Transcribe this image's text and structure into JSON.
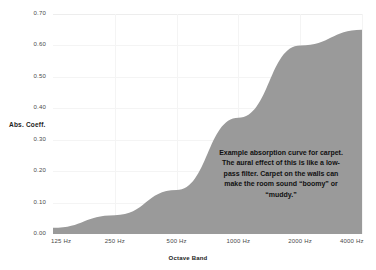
{
  "chart_data": {
    "type": "area",
    "title": "",
    "xlabel": "Octave Band",
    "ylabel": "Abs. Coeff.",
    "categories": [
      "125 Hz",
      "250 Hz",
      "500 Hz",
      "1000 Hz",
      "2000 Hz",
      "4000 Hz"
    ],
    "values": [
      0.02,
      0.06,
      0.14,
      0.37,
      0.6,
      0.65
    ],
    "ylim": [
      0.0,
      0.7
    ],
    "yticks": [
      "0.00",
      "0.10",
      "0.20",
      "0.30",
      "0.40",
      "0.50",
      "0.60",
      "0.70"
    ],
    "ytick_values": [
      0.0,
      0.1,
      0.2,
      0.3,
      0.4,
      0.5,
      0.6,
      0.7
    ],
    "grid": true,
    "legend": "none",
    "fill_color": "#9a9a9a",
    "annotations": [
      {
        "text": "Example absorption curve for carpet. The aural effect of this is like a low-pass filter. Carpet on the walls can make the room sound “boomy” or “muddy.”"
      }
    ]
  },
  "axes": {
    "y_title": "Abs. Coeff.",
    "x_title": "Octave Band"
  },
  "annotation": {
    "text": "Example absorption curve for carpet. The aural effect of this is like a low-pass filter. Carpet on the walls can make the room sound “boomy” or “muddy.”"
  }
}
